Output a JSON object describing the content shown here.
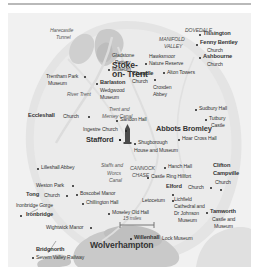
{
  "map": {
    "title_region": "Staffordshire and the West Midlands tourist map",
    "scale_label": "15 miles",
    "background_color": "#f1f1f1",
    "land_color": "#e4e4e4",
    "urban_color": "#c9c9c9",
    "water_color": "#d8d8d8",
    "cities": [
      {
        "name": "Stoke-on-Trent",
        "line1": "Stoke-",
        "line2": "on- Trent",
        "x": 112,
        "y": 54,
        "size": "xl"
      },
      {
        "name": "Wolverhampton",
        "line1": "Wolverhampton",
        "x": 108,
        "y": 231,
        "size": "xl"
      },
      {
        "name": "Stafford",
        "line1": "Stafford",
        "x": 93,
        "y": 126,
        "size": "lg",
        "dot": true
      }
    ],
    "regions": [
      {
        "label": "DOVEDALE",
        "x": 191,
        "y": 17
      },
      {
        "label": "MANIFOLD",
        "x": 172,
        "y": 26
      },
      {
        "label": "VALLEY",
        "x": 176,
        "y": 33
      },
      {
        "label": "CANNOCK",
        "x": 135,
        "y": 155
      },
      {
        "label": "CHASE",
        "x": 137,
        "y": 162
      }
    ],
    "waterways": [
      {
        "label": "River Trent",
        "x": 78,
        "y": 81
      },
      {
        "label": "Trent and",
        "x": 115,
        "y": 96
      },
      {
        "label": "Mersey Canal",
        "x": 109,
        "y": 103
      },
      {
        "label": "Staffs and",
        "x": 106,
        "y": 152
      },
      {
        "label": "Worcs",
        "x": 112,
        "y": 160
      },
      {
        "label": "Canal",
        "x": 114,
        "y": 167
      }
    ],
    "places": [
      {
        "label": "Harecastle",
        "sub": "Tunnel",
        "x": 56,
        "y": 19,
        "style": "italic"
      },
      {
        "label": "Gladstone",
        "x": 110,
        "y": 42,
        "style": "plain"
      },
      {
        "label": "Pottery",
        "x": 112,
        "y": 49,
        "style": "plain"
      },
      {
        "label": "Museum",
        "x": 108,
        "y": 56,
        "style": "plain",
        "dot_left": true
      },
      {
        "label": "Hawksmoor",
        "x": 148,
        "y": 43,
        "style": "plain"
      },
      {
        "label": "Nature Reserve",
        "x": 145,
        "y": 50,
        "style": "plain",
        "dot_left": true
      },
      {
        "label": "Tissington",
        "x": 198,
        "y": 21,
        "style": "bold",
        "dot_left": true
      },
      {
        "label": "Fenny Bentley",
        "x": 196,
        "y": 31,
        "style": "bold",
        "dot_left": true
      },
      {
        "label": "Church",
        "x": 200,
        "y": 38,
        "style": "plain"
      },
      {
        "label": "Ashbourne",
        "x": 199,
        "y": 45,
        "style": "bold",
        "dot_left": true
      },
      {
        "label": "Church",
        "x": 201,
        "y": 52,
        "style": "plain"
      },
      {
        "label": "Alton Towers",
        "x": 163,
        "y": 60,
        "style": "plain",
        "dot_left": true
      },
      {
        "label": "Cheadle",
        "x": 131,
        "y": 61,
        "style": "bold"
      },
      {
        "label": "Church",
        "x": 131,
        "y": 68,
        "style": "plain"
      },
      {
        "label": "Croxden",
        "x": 153,
        "y": 74,
        "style": "plain"
      },
      {
        "label": "Abbey",
        "x": 153,
        "y": 81,
        "style": "plain"
      },
      {
        "label": "Trentham Park",
        "x": 46,
        "y": 63,
        "style": "plain",
        "dot_right": true
      },
      {
        "label": "Museum",
        "x": 48,
        "y": 70,
        "style": "plain"
      },
      {
        "label": "Barlaston",
        "x": 99,
        "y": 70,
        "style": "bold",
        "dot_left": true
      },
      {
        "label": "Wedgwood",
        "x": 99,
        "y": 77,
        "style": "plain"
      },
      {
        "label": "Museum",
        "x": 99,
        "y": 84,
        "style": "plain"
      },
      {
        "label": "Sudbury Hall",
        "x": 196,
        "y": 96,
        "style": "plain",
        "dot_left": true
      },
      {
        "label": "Eccleshall",
        "x": 28,
        "y": 103,
        "style": "bold"
      },
      {
        "label": "Church",
        "x": 56,
        "y": 103,
        "style": "plain",
        "dot_right": true
      },
      {
        "label": "Sandon Hall",
        "x": 117,
        "y": 107,
        "style": "plain",
        "dot_left": true
      },
      {
        "label": "Tutbury",
        "x": 207,
        "y": 106,
        "style": "plain",
        "dot_left": true
      },
      {
        "label": "Castle",
        "x": 210,
        "y": 113,
        "style": "plain"
      },
      {
        "label": "Ingestre Church",
        "x": 85,
        "y": 116,
        "style": "plain",
        "dot_right": true
      },
      {
        "label": "Abbots Bromley",
        "x": 160,
        "y": 116,
        "style": "bold"
      },
      {
        "label": "Hoar Cross Hall",
        "x": 182,
        "y": 126,
        "style": "plain",
        "dot_left": true
      },
      {
        "label": "Shugborough",
        "x": 130,
        "y": 130,
        "style": "plain",
        "dot_left": true
      },
      {
        "label": "House and Museum",
        "x": 128,
        "y": 137,
        "style": "plain"
      },
      {
        "label": "Lilleshall Abbey",
        "x": 38,
        "y": 155,
        "style": "plain",
        "dot_left": true
      },
      {
        "label": "Hanch Hall",
        "x": 165,
        "y": 154,
        "style": "plain",
        "dot_left": true
      },
      {
        "label": "Castle Ring Hillfort",
        "x": 147,
        "y": 164,
        "style": "plain",
        "dot_left": true
      },
      {
        "label": "Clifton",
        "x": 211,
        "y": 154,
        "style": "bold"
      },
      {
        "label": "Campville",
        "x": 211,
        "y": 162,
        "style": "bold"
      },
      {
        "label": "Church",
        "x": 213,
        "y": 170,
        "style": "plain"
      },
      {
        "label": "Weston Park",
        "x": 34,
        "y": 172,
        "style": "plain",
        "dot_right": true
      },
      {
        "label": "Elford",
        "x": 166,
        "y": 174,
        "style": "bold"
      },
      {
        "label": "Church",
        "x": 185,
        "y": 174,
        "style": "plain",
        "dot_right": true
      },
      {
        "label": "Tong",
        "x": 24,
        "y": 182,
        "style": "bold"
      },
      {
        "label": "Church",
        "x": 40,
        "y": 182,
        "style": "plain",
        "dot_right": true
      },
      {
        "label": "Boscobel Manor",
        "x": 75,
        "y": 181,
        "style": "plain",
        "dot_left": true
      },
      {
        "label": "Chillington Hall",
        "x": 81,
        "y": 190,
        "style": "plain",
        "dot_left": true
      },
      {
        "label": "Letocetum",
        "x": 144,
        "y": 187,
        "style": "plain",
        "dot_right": true
      },
      {
        "label": "Lichfield",
        "x": 173,
        "y": 186,
        "style": "plain"
      },
      {
        "label": "Cathedral and",
        "x": 173,
        "y": 193,
        "style": "plain"
      },
      {
        "label": "Dr Johnson",
        "x": 173,
        "y": 200,
        "style": "plain"
      },
      {
        "label": "Museum",
        "x": 177,
        "y": 207,
        "style": "plain"
      },
      {
        "label": "Tamworth",
        "x": 206,
        "y": 200,
        "style": "bold",
        "dot_left": true
      },
      {
        "label": "Castle and",
        "x": 208,
        "y": 207,
        "style": "plain"
      },
      {
        "label": "Museum",
        "x": 210,
        "y": 214,
        "style": "plain"
      },
      {
        "label": "Ironbridge Gorge",
        "x": 15,
        "y": 192,
        "style": "plain"
      },
      {
        "label": "Ironbridge",
        "x": 20,
        "y": 202,
        "style": "bold",
        "dot_left": true
      },
      {
        "label": "Moseley Old Hall",
        "x": 108,
        "y": 200,
        "style": "plain",
        "dot_left": true
      },
      {
        "label": "Wightwick Manor",
        "x": 46,
        "y": 214,
        "style": "plain",
        "dot_right": true
      },
      {
        "label": "Willenhall",
        "x": 130,
        "y": 225,
        "style": "bold",
        "dot_left": true
      },
      {
        "label": "Lock Museum",
        "x": 157,
        "y": 225,
        "style": "plain"
      },
      {
        "label": "Bridgnorth",
        "x": 33,
        "y": 236,
        "style": "bold"
      },
      {
        "label": "Severn Valley Railway",
        "x": 32,
        "y": 244,
        "style": "plain",
        "dot_left": true
      }
    ]
  }
}
